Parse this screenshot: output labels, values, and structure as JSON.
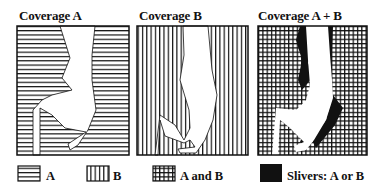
{
  "figure": {
    "panels": [
      {
        "id": "coverage-a",
        "title": "Coverage A",
        "pattern": "horizontal-lines"
      },
      {
        "id": "coverage-b",
        "title": "Coverage B",
        "pattern": "vertical-lines"
      },
      {
        "id": "coverage-a-plus-b",
        "title": "Coverage A + B",
        "pattern": "grid-with-black-slivers"
      }
    ],
    "legend": [
      {
        "swatch": "horizontal-lines",
        "label": "A"
      },
      {
        "swatch": "vertical-lines",
        "label": "B"
      },
      {
        "swatch": "grid",
        "label": "A and B"
      },
      {
        "swatch": "solid-black",
        "label": "Slivers: A or B"
      }
    ],
    "colors": {
      "ink": "#111111",
      "background": "#ffffff"
    }
  }
}
